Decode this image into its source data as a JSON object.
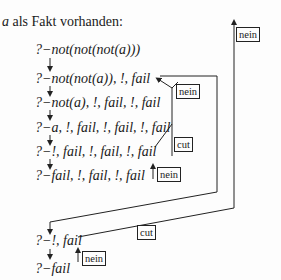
{
  "title": {
    "var": "a",
    "text": " als Fakt vorhanden:"
  },
  "goals": [
    "?−not(not(not(a)))",
    "?−not(not(a)), !, fail",
    "?−not(a), !, fail, !, fail",
    "?−a, !, fail, !, fail, !, fail",
    "?−!, fail, !, fail, !, fail",
    "?−fail, !, fail, !, fail",
    "?−!, fail",
    "?−fail"
  ],
  "labels": {
    "nein_outer": "nein",
    "nein_1": "nein",
    "cut_1": "cut",
    "nein_2": "nein",
    "cut_2": "cut",
    "nein_3": "nein"
  },
  "colors": {
    "line": "#222222",
    "text": "#1a1a1a",
    "background": "#fdfdfd"
  }
}
